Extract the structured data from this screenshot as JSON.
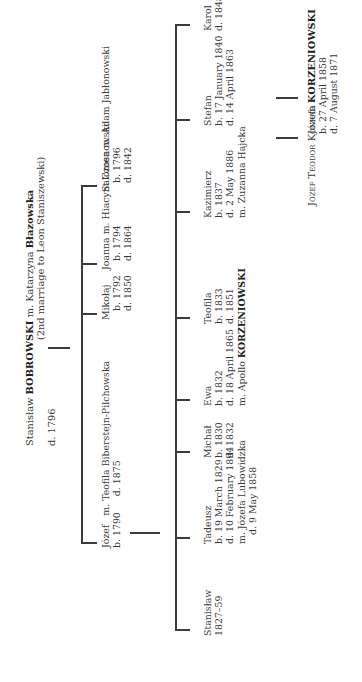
{
  "root": {
    "line1_pre": "Stanisław ",
    "line1_surname": "BOBROWSKI",
    "line1_mid": " m. Katarzyna ",
    "line1_wife": "Błazowska",
    "line2": "(2nd marriage to Leon Staniszewski)",
    "death": "d. 1796"
  },
  "generation2": [
    {
      "name_line": "Józef   m. Teofila Biberstejn-Pilchowska",
      "born": "b. 1790",
      "died": "d. 1875"
    },
    {
      "name_line": "Mikołaj",
      "born": "b. 1792",
      "died": "d. 1850"
    },
    {
      "name_line": "Joanna m. Hiacynt Czosnowski",
      "born": "b. 1794",
      "died": "d. 1864"
    },
    {
      "name_line": "Salomea m. Adam Jabłonowski",
      "born": "b. 1796",
      "died": "d. 1842"
    }
  ],
  "generation3": [
    {
      "name": "Stanisław",
      "lines": [
        "1827–59"
      ]
    },
    {
      "name": "Tadeusz",
      "lines": [
        "b. 19 March 1829",
        "d. 10 February 1894",
        "m. Józefa Lubowidzka",
        "d. 9 May 1858"
      ]
    },
    {
      "name": "Michał",
      "lines": [
        "b. 1830",
        "d. 1832"
      ]
    },
    {
      "name": "Ewa",
      "lines": [
        "b. 1832",
        "d. 18 April 1865"
      ],
      "spouse_pre": "m. Apollo ",
      "spouse_surname": "KORZENIOWSKI"
    },
    {
      "name": "Teofila",
      "lines": [
        "b. 1833",
        "d. 1851"
      ]
    },
    {
      "name": "Kazimierz",
      "lines": [
        "b. 1837",
        "d. 2 May 1886",
        "m. Zuzanna Hajcka"
      ]
    },
    {
      "name": "Stefan",
      "lines": [
        "b. 17 January 1840",
        "d. 14 April 1863"
      ]
    },
    {
      "name": "Karol",
      "lines": [
        "d. 1848"
      ]
    }
  ],
  "generation4": [
    {
      "name": "Józefa",
      "lines": [
        "b. 27 April 1858",
        "d. 7 August 1871"
      ]
    },
    {
      "name_pre": "Józef Teodor Konrad ",
      "surname": "KORZENIOWSKI"
    }
  ]
}
